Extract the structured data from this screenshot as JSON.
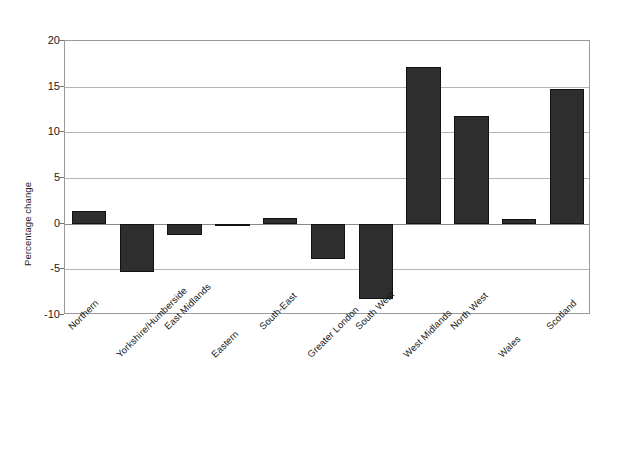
{
  "chart_data": {
    "type": "bar",
    "title": "",
    "xlabel": "",
    "ylabel": "Percentage change",
    "ylim": [
      -10,
      20
    ],
    "yticks": [
      20,
      15,
      10,
      5,
      0,
      -5,
      -10
    ],
    "ytick_labels": [
      "20",
      "15",
      "10",
      "5",
      "0",
      "-5",
      "-10"
    ],
    "grid": true,
    "legend": "none",
    "bar_color": "#2e2e2e",
    "categories": [
      "Northern",
      "Yorkshire/Humberside",
      "East Midlands",
      "Eastern",
      "South-East",
      "Greater London",
      "South West",
      "West Midlands",
      "North West",
      "Wales",
      "Scotland"
    ],
    "values": [
      1.4,
      -5.3,
      -1.2,
      -0.3,
      0.6,
      -3.9,
      -8.2,
      17.2,
      11.8,
      0.5,
      14.7
    ]
  }
}
